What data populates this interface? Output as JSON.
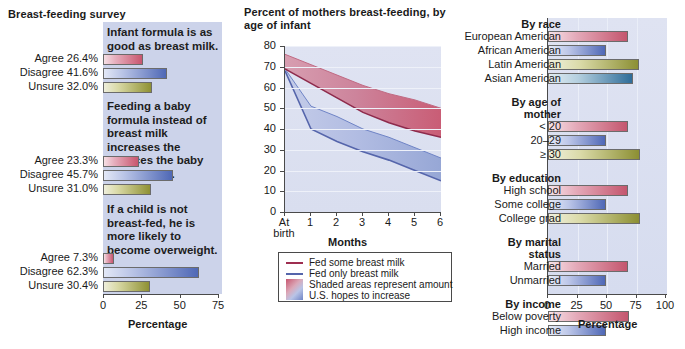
{
  "left": {
    "title": "Breast-feeding survey",
    "axis_title": "Percentage",
    "ticks": [
      "0",
      "25",
      "50",
      "75"
    ],
    "xmax": 75,
    "questions": [
      {
        "statement": "Infant formula is as good as breast milk.",
        "rows": [
          {
            "label": "Agree 26.4%",
            "value": 26.4,
            "color_key": "agree"
          },
          {
            "label": "Disagree 41.6%",
            "value": 41.6,
            "color_key": "disagree"
          },
          {
            "label": "Unsure 32.0%",
            "value": 32.0,
            "color_key": "unsure"
          }
        ]
      },
      {
        "statement": "Feeding a baby formula instead of breast milk increases the chances the baby will get sick.",
        "rows": [
          {
            "label": "Agree 23.3%",
            "value": 23.3,
            "color_key": "agree"
          },
          {
            "label": "Disagree 45.7%",
            "value": 45.7,
            "color_key": "disagree"
          },
          {
            "label": "Unsure 31.0%",
            "value": 31.0,
            "color_key": "unsure"
          }
        ]
      },
      {
        "statement": "If a child is not breast-fed, he is more likely to become overweight.",
        "rows": [
          {
            "label": "Agree 7.3%",
            "value": 7.3,
            "color_key": "agree"
          },
          {
            "label": "Disagree 62.3%",
            "value": 62.3,
            "color_key": "disagree"
          },
          {
            "label": "Unsure 30.4%",
            "value": 30.4,
            "color_key": "unsure"
          }
        ]
      }
    ]
  },
  "middle": {
    "title": "Percent of mothers breast-feeding, by age of infant",
    "xlabel": "Months",
    "legend": [
      {
        "type": "line",
        "label": "Fed some breast milk",
        "color": "#9e2e50"
      },
      {
        "type": "line",
        "label": "Fed only breast milk",
        "color": "#5565ab"
      },
      {
        "type": "swatch",
        "label": "Shaded areas represent amount",
        "color": "#c8566f"
      },
      {
        "type": "cont",
        "label": "U.S. hopes to increase",
        "color": "#6f84c6"
      }
    ]
  },
  "right": {
    "axis_title": "Percentage",
    "ticks": [
      "0",
      "25",
      "50",
      "75",
      "100"
    ],
    "xmax": 100,
    "groups": [
      {
        "header": "By race",
        "rows": [
          {
            "label": "European American",
            "value": 68,
            "color_key": "pink"
          },
          {
            "label": "African American",
            "value": 49,
            "color_key": "blue"
          },
          {
            "label": "Latin American",
            "value": 77,
            "color_key": "olive"
          },
          {
            "label": "Asian American",
            "value": 72,
            "color_key": "teal"
          }
        ]
      },
      {
        "header": "By age of mother",
        "rows": [
          {
            "label": "< 20",
            "value": 68,
            "color_key": "pink"
          },
          {
            "label": "20–29",
            "value": 49,
            "color_key": "blue"
          },
          {
            "label": "≥ 30",
            "value": 78,
            "color_key": "olive"
          }
        ]
      },
      {
        "header": "By education",
        "rows": [
          {
            "label": "High school",
            "value": 68,
            "color_key": "pink"
          },
          {
            "label": "Some college",
            "value": 49,
            "color_key": "blue"
          },
          {
            "label": "College grad",
            "value": 78,
            "color_key": "olive"
          }
        ]
      },
      {
        "header": "By marital status",
        "rows": [
          {
            "label": "Married",
            "value": 68,
            "color_key": "pink"
          },
          {
            "label": "Unmarried",
            "value": 49,
            "color_key": "blue"
          }
        ]
      },
      {
        "header": "By income",
        "rows": [
          {
            "label": "Below poverty",
            "value": 69,
            "color_key": "pink"
          },
          {
            "label": "High income",
            "value": 49,
            "color_key": "blue"
          }
        ]
      }
    ]
  },
  "chart_data": [
    {
      "type": "bar",
      "title": "Breast-feeding survey",
      "xlabel": "Percentage",
      "ylabel": "",
      "xlim": [
        0,
        75
      ],
      "grid": false,
      "orientation": "horizontal",
      "groups": [
        {
          "name": "Infant formula is as good as breast milk.",
          "categories": [
            "Agree",
            "Disagree",
            "Unsure"
          ],
          "values": [
            26.4,
            41.6,
            32.0
          ]
        },
        {
          "name": "Feeding a baby formula instead of breast milk increases the chances the baby will get sick.",
          "categories": [
            "Agree",
            "Disagree",
            "Unsure"
          ],
          "values": [
            23.3,
            45.7,
            31.0
          ]
        },
        {
          "name": "If a child is not breast-fed, he is more likely to become overweight.",
          "categories": [
            "Agree",
            "Disagree",
            "Unsure"
          ],
          "values": [
            7.3,
            62.3,
            30.4
          ]
        }
      ]
    },
    {
      "type": "area",
      "title": "Percent of mothers breast-feeding, by age of infant",
      "xlabel": "Months",
      "ylabel": "",
      "x": [
        "At birth",
        "1",
        "2",
        "3",
        "4",
        "5",
        "6"
      ],
      "xlim": [
        0,
        6
      ],
      "ylim": [
        0,
        80
      ],
      "yticks": [
        0,
        10,
        20,
        30,
        40,
        50,
        60,
        70,
        80
      ],
      "grid": true,
      "legend_position": "below",
      "annotation": "Shaded areas represent amount U.S. hopes to increase",
      "series": [
        {
          "name": "Fed some breast milk",
          "values": [
            69,
            62,
            55,
            48,
            43,
            39,
            36
          ],
          "color": "#9e2e50"
        },
        {
          "name": "Fed some breast milk (U.S. goal)",
          "values": [
            76,
            71,
            66,
            61,
            57,
            54,
            50
          ],
          "color": "#c8566f",
          "role": "target"
        },
        {
          "name": "Fed only breast milk",
          "values": [
            68,
            40,
            34,
            29,
            25,
            20,
            15
          ],
          "color": "#5565ab"
        },
        {
          "name": "Fed only breast milk (U.S. goal)",
          "values": [
            69,
            51,
            46,
            40,
            36,
            31,
            26
          ],
          "color": "#6f84c6",
          "role": "target"
        }
      ]
    },
    {
      "type": "bar",
      "title": "",
      "xlabel": "Percentage",
      "ylabel": "",
      "xlim": [
        0,
        100
      ],
      "grid": true,
      "orientation": "horizontal",
      "groups": [
        {
          "name": "By race",
          "categories": [
            "European American",
            "African American",
            "Latin American",
            "Asian American"
          ],
          "values": [
            68,
            49,
            77,
            72
          ]
        },
        {
          "name": "By age of mother",
          "categories": [
            "< 20",
            "20–29",
            "≥ 30"
          ],
          "values": [
            68,
            49,
            78
          ]
        },
        {
          "name": "By education",
          "categories": [
            "High school",
            "Some college",
            "College grad"
          ],
          "values": [
            68,
            49,
            78
          ]
        },
        {
          "name": "By marital status",
          "categories": [
            "Married",
            "Unmarried"
          ],
          "values": [
            68,
            49
          ]
        },
        {
          "name": "By income",
          "categories": [
            "Below poverty",
            "High income"
          ],
          "values": [
            69,
            49
          ]
        }
      ]
    }
  ]
}
